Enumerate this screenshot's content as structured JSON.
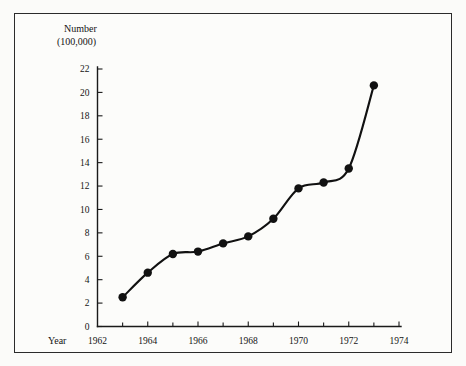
{
  "chart_data": {
    "type": "line",
    "title": "",
    "ylabel_line1": "Number",
    "ylabel_line2": "(100,000)",
    "xlabel": "Year",
    "x": [
      1963,
      1964,
      1965,
      1966,
      1967,
      1968,
      1969,
      1970,
      1971,
      1972,
      1973
    ],
    "values": [
      2.5,
      4.6,
      6.2,
      6.4,
      7.1,
      7.7,
      9.2,
      11.8,
      12.3,
      13.5,
      20.6
    ],
    "series": [
      {
        "name": "Number (100,000)",
        "values": [
          2.5,
          4.6,
          6.2,
          6.4,
          7.1,
          7.7,
          9.2,
          11.8,
          12.3,
          13.5,
          20.6
        ]
      }
    ],
    "xlim": [
      1962,
      1974
    ],
    "ylim": [
      0,
      22
    ],
    "ytick_labels": [
      "0",
      "2",
      "4",
      "6",
      "8",
      "10",
      "12",
      "14",
      "16",
      "18",
      "20",
      "22"
    ],
    "ytick_values": [
      0,
      2,
      4,
      6,
      8,
      10,
      12,
      14,
      16,
      18,
      20,
      22
    ],
    "xtick_labels": [
      "1962",
      "1964",
      "1966",
      "1968",
      "1970",
      "1972",
      "1974"
    ],
    "xtick_values": [
      1962,
      1964,
      1966,
      1968,
      1970,
      1972,
      1974
    ],
    "xminor_values": [
      1963,
      1965,
      1967,
      1969,
      1971,
      1973
    ],
    "grid": false,
    "legend": false,
    "marker": "filled-circle",
    "line_color": "#111111",
    "marker_color": "#111111",
    "background_color": "#fcfcfa",
    "border_color": "#2b2b2b"
  }
}
